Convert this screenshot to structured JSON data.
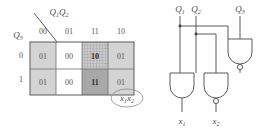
{
  "figure": {
    "kmap": {
      "col_var_label": "Q1Q2",
      "col_var_main": "Q",
      "col_var_sub": "1",
      "col_var_main2": "Q",
      "col_var_sub2": "2",
      "row_var_main": "Q",
      "row_var_sub": "3",
      "column_headers": [
        "00",
        "01",
        "11",
        "10"
      ],
      "row_headers": [
        "0",
        "1"
      ],
      "cells": [
        [
          {
            "value": "01",
            "shade": "light",
            "highlight": false
          },
          {
            "value": "00",
            "shade": "none",
            "highlight": false
          },
          {
            "value": "10",
            "shade": "hatch",
            "highlight": true
          },
          {
            "value": "01",
            "shade": "light",
            "highlight": false
          }
        ],
        [
          {
            "value": "01",
            "shade": "light",
            "highlight": false
          },
          {
            "value": "00",
            "shade": "none",
            "highlight": false
          },
          {
            "value": "11",
            "shade": "dark",
            "highlight": true
          },
          {
            "value": "01",
            "shade": "light",
            "highlight": false
          }
        ]
      ],
      "output_label_main1": "x",
      "output_label_sub1": "1",
      "output_label_main2": "x",
      "output_label_sub2": "2"
    },
    "circuit": {
      "inputs": [
        {
          "main": "Q",
          "sub": "1"
        },
        {
          "main": "Q",
          "sub": "2"
        },
        {
          "main": "Q",
          "sub": "3"
        }
      ],
      "outputs": [
        {
          "main": "x",
          "sub": "1",
          "inverted": false
        },
        {
          "main": "x",
          "sub": "2",
          "inverted": true
        }
      ],
      "gates": [
        {
          "name": "nand-gate-top",
          "type": "NAND",
          "inverted": true
        },
        {
          "name": "and-gate-left",
          "type": "AND",
          "inverted": false
        },
        {
          "name": "and-gate-right",
          "type": "NAND",
          "inverted": true
        }
      ]
    },
    "colors": {
      "ink": "#5a5a5a",
      "shade_light": "#d4d4d4",
      "shade_dark": "#a8a8a8",
      "background": "#ffffff"
    }
  }
}
